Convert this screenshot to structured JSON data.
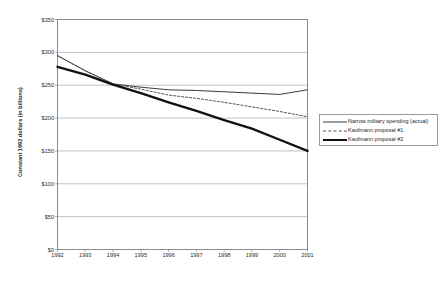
{
  "chart_data": {
    "type": "line",
    "title": "",
    "xlabel": "",
    "ylabel": "Constant 1992 dollars (in billions)",
    "x": [
      1992,
      1993,
      1994,
      1995,
      1996,
      1997,
      1998,
      1999,
      2000,
      2001
    ],
    "xticklabels": [
      "1992",
      "1993",
      "1994",
      "1995",
      "1996",
      "1997",
      "1998",
      "1999",
      "2000",
      "2001"
    ],
    "yticklabels": [
      "$0",
      "$50",
      "$100",
      "$150",
      "$200",
      "$250",
      "$300",
      "$350"
    ],
    "ytickvalues": [
      0,
      50,
      100,
      150,
      200,
      250,
      300,
      350
    ],
    "ylim": [
      0,
      350
    ],
    "xlim": [
      1992,
      2001
    ],
    "grid": "horizontal",
    "legend_position": "right-middle",
    "series": [
      {
        "name": "Narrow military spending (actual)",
        "style": "solid-thin",
        "color": "#3a3a3a",
        "values": [
          295,
          272,
          252,
          247,
          243,
          242,
          240,
          238,
          236,
          243
        ]
      },
      {
        "name": "Kaufmann proposal #1",
        "style": "dotted",
        "color": "#555555",
        "values": [
          295,
          272,
          252,
          244,
          235,
          230,
          224,
          217,
          210,
          202
        ]
      },
      {
        "name": "Kaufmann proposal #2",
        "style": "solid-thick",
        "color": "#111111",
        "values": [
          278,
          266,
          251,
          238,
          224,
          211,
          197,
          184,
          167,
          150
        ]
      }
    ]
  },
  "legend": {
    "entries": [
      "Narrow military spending (actual)",
      "Kaufmann proposal #1",
      "Kaufmann proposal #2"
    ]
  }
}
